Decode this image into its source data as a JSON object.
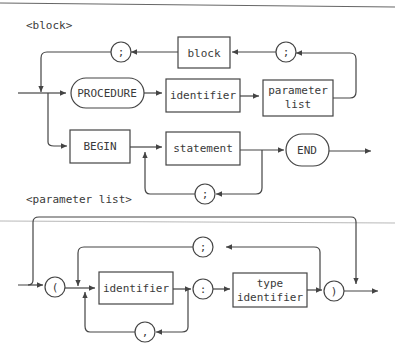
{
  "diagrams": [
    {
      "title": "<block>",
      "terminals": [
        {
          "id": "procedure",
          "label": "PROCEDURE"
        },
        {
          "id": "begin",
          "label": "BEGIN"
        },
        {
          "id": "end",
          "label": "END"
        },
        {
          "id": "semicolon-top",
          "label": ";"
        },
        {
          "id": "semicolon-right",
          "label": ";"
        },
        {
          "id": "semicolon-stmt",
          "label": ";"
        }
      ],
      "nonterminals": [
        {
          "id": "block",
          "label": "block"
        },
        {
          "id": "identifier",
          "label": "identifier"
        },
        {
          "id": "parameter-list",
          "label": "parameter\nlist",
          "line1": "parameter",
          "line2": "list"
        },
        {
          "id": "statement",
          "label": "statement"
        }
      ]
    },
    {
      "title": "<parameter list>",
      "terminals": [
        {
          "id": "lparen",
          "label": "("
        },
        {
          "id": "colon",
          "label": ":"
        },
        {
          "id": "semicolon",
          "label": ";"
        },
        {
          "id": "comma",
          "label": ","
        },
        {
          "id": "rparen",
          "label": ")"
        }
      ],
      "nonterminals": [
        {
          "id": "identifier",
          "label": "identifier"
        },
        {
          "id": "type-identifier",
          "label": "type identifier",
          "line1": "type",
          "line2": "identifier"
        }
      ]
    }
  ]
}
